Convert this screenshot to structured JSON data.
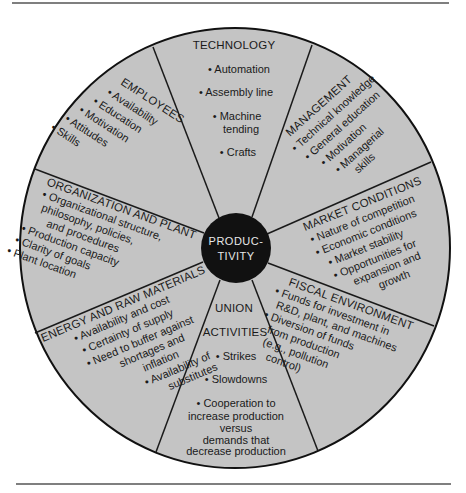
{
  "diagram": {
    "type": "wheel",
    "center": {
      "label_line1": "PRODUC-",
      "label_line2": "TIVITY"
    },
    "colors": {
      "segment_fill": "#c4c4c4",
      "center_fill": "#111111",
      "line": "#1a1a1a",
      "center_text": "#e8e8e8"
    },
    "segments": {
      "technology": {
        "title": "TECHNOLOGY",
        "items": [
          "Automation",
          "Assembly line",
          "Machine",
          "tending",
          "Crafts"
        ]
      },
      "management": {
        "title": "MANAGEMENT",
        "items": [
          "Technical knowledge",
          "General education",
          "Motivation",
          "Managerial",
          "skills"
        ]
      },
      "market_conditions": {
        "title": "MARKET CONDITIONS",
        "items": [
          "Nature of competition",
          "Economic conditions",
          "Market stability",
          "Opportunities for",
          "expansion and",
          "growth"
        ]
      },
      "fiscal_environment": {
        "title": "FISCAL ENVIRONMENT",
        "items": [
          "Funds for investment in",
          "R&D, plant, and machines",
          "Diversion of funds",
          "from production",
          "(e.g., pollution",
          "control)"
        ]
      },
      "union_activities": {
        "title_line1": "UNION",
        "title_line2": "ACTIVITIES",
        "items": [
          "Strikes",
          "Slowdowns",
          "Cooperation to",
          "increase production",
          "versus",
          "demands that",
          "decrease production"
        ]
      },
      "energy_raw_materials": {
        "title": "ENERGY AND RAW MATERIALS",
        "items": [
          "Availability and cost",
          "Certainty of supply",
          "Need to buffer against",
          "shortages and",
          "inflation",
          "Availability of",
          "substitutes"
        ]
      },
      "organization_plant": {
        "title": "ORGANIZATION AND PLANT",
        "items": [
          "Organizational structure,",
          "philosophy, policies,",
          "and procedures",
          "Production capacity",
          "Clarity of goals",
          "Plant location"
        ]
      },
      "employees": {
        "title": "EMPLOYEES",
        "items": [
          "Availability",
          "Education",
          "Motivation",
          "Attitudes",
          "Skills"
        ]
      }
    },
    "bullet": "•"
  }
}
